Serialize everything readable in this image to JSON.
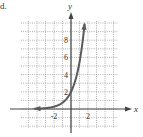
{
  "figure_label": "d.",
  "chart_data": {
    "type": "line",
    "title": "",
    "xlabel": "x",
    "ylabel": "y",
    "xlim": [
      -6,
      5.5
    ],
    "ylim": [
      -2.3,
      10.3
    ],
    "grid": true,
    "grid_style": "dotted",
    "x_ticks": [
      {
        "value": -2,
        "label": "-2"
      },
      {
        "value": 2,
        "label": "2"
      }
    ],
    "y_ticks": [
      {
        "value": 2,
        "label": "2"
      },
      {
        "value": 4,
        "label": "4"
      },
      {
        "value": 6,
        "label": "6"
      },
      {
        "value": 8,
        "label": "8"
      }
    ],
    "series": [
      {
        "name": "curve",
        "function": "y = 2e^x",
        "x": [
          -4.5,
          -4,
          -3,
          -2,
          -1,
          0,
          0.5,
          1,
          1.3,
          1.6
        ],
        "y": [
          0.02,
          0.04,
          0.1,
          0.27,
          0.74,
          2.0,
          3.3,
          5.44,
          7.34,
          9.9
        ],
        "arrows": "both ends",
        "asymptote": "y = 0",
        "color": "#555555"
      }
    ]
  }
}
